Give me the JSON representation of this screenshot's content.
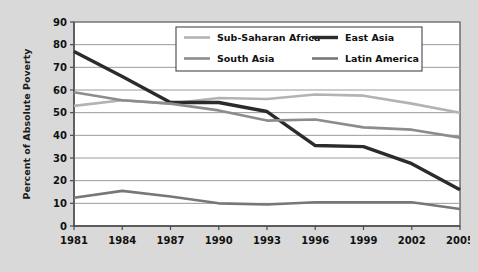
{
  "chart_data": {
    "type": "line",
    "title": "",
    "xlabel": "",
    "ylabel": "Percent of Absolute Poverty",
    "x": [
      "1981",
      "1984",
      "1987",
      "1990",
      "1993",
      "1996",
      "1999",
      "2002",
      "2005"
    ],
    "xlim": [
      0,
      8
    ],
    "ylim": [
      0,
      90
    ],
    "yticks": [
      "0",
      "10",
      "20",
      "30",
      "40",
      "50",
      "60",
      "70",
      "80",
      "90"
    ],
    "grid": true,
    "legend_position": "top-center",
    "series": [
      {
        "name": "Sub-Saharan Africa",
        "color": "#b3b3b3",
        "width": 2.6,
        "values": [
          53,
          55.5,
          54,
          56.5,
          56,
          58,
          57.5,
          54,
          50
        ]
      },
      {
        "name": "East Asia",
        "color": "#2b2b2b",
        "width": 3.4,
        "values": [
          77,
          66,
          54.5,
          54.5,
          50.5,
          35.5,
          35,
          27.5,
          16
        ]
      },
      {
        "name": "South Asia",
        "color": "#8c8c8c",
        "width": 2.6,
        "values": [
          59,
          55.5,
          54,
          51,
          46.5,
          47,
          43.5,
          42.5,
          39
        ]
      },
      {
        "name": "Latin America",
        "color": "#777777",
        "width": 2.6,
        "values": [
          12.5,
          15.5,
          13,
          10,
          9.5,
          10.5,
          10.5,
          10.5,
          7.5
        ]
      }
    ]
  },
  "legend": {
    "entries": [
      {
        "label": "Sub-Saharan Africa"
      },
      {
        "label": "East Asia"
      },
      {
        "label": "South Asia"
      },
      {
        "label": "Latin America"
      }
    ]
  },
  "colors": {
    "figure_background": "#d9d9d9",
    "plot_background": "#ffffff",
    "gridline": "#9a9a9a",
    "axis": "#4d4d4d",
    "text": "#111111"
  }
}
